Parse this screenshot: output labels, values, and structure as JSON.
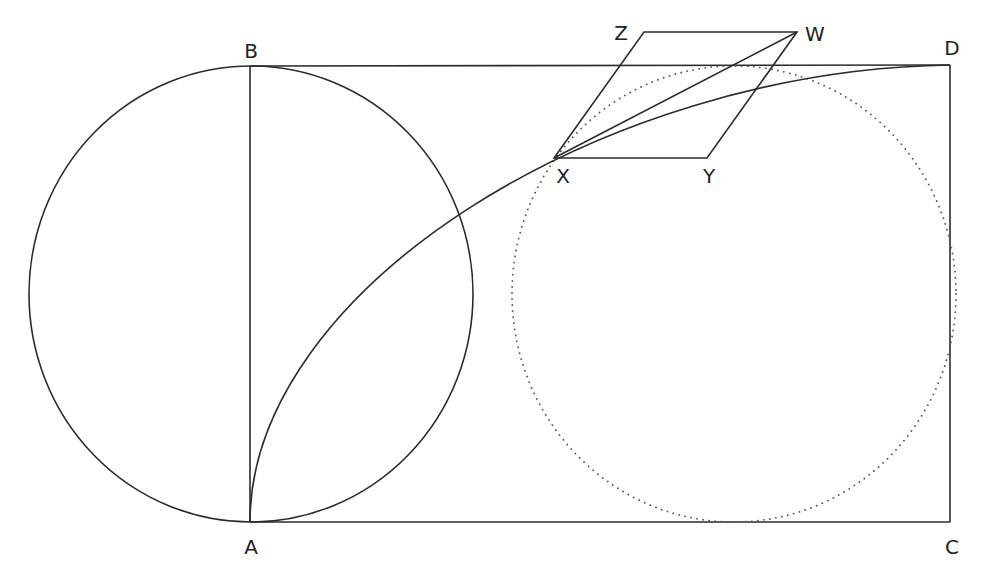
{
  "diagram": {
    "type": "geometric-construction",
    "labels": {
      "A": "A",
      "B": "B",
      "C": "C",
      "D": "D",
      "W": "W",
      "X": "X",
      "Y": "Y",
      "Z": "Z"
    },
    "points": {
      "A": [
        250,
        522
      ],
      "B": [
        250,
        66
      ],
      "C": [
        950,
        522
      ],
      "D": [
        950,
        65
      ],
      "X": [
        554,
        158
      ],
      "Y": [
        707,
        158
      ],
      "Z": [
        644,
        32
      ],
      "W": [
        797,
        32
      ]
    },
    "shapes": [
      {
        "kind": "ellipse",
        "style": "solid",
        "center": [
          251,
          294
        ],
        "rx": 222,
        "ry": 228,
        "description": "circle with diameter AB"
      },
      {
        "kind": "ellipse",
        "style": "dotted",
        "center": [
          734,
          294
        ],
        "rx": 222,
        "ry": 228,
        "description": "dotted circle inscribed in right part of rectangle"
      },
      {
        "kind": "segment",
        "from": "A",
        "to": "B"
      },
      {
        "kind": "segment",
        "from": "B",
        "to": "D"
      },
      {
        "kind": "segment",
        "from": "D",
        "to": "C"
      },
      {
        "kind": "segment",
        "from": "A",
        "to": "C"
      },
      {
        "kind": "curve",
        "from": "A",
        "to": "D",
        "through": "X"
      },
      {
        "kind": "parallelogram",
        "vertices": [
          "X",
          "Y",
          "W",
          "Z"
        ]
      },
      {
        "kind": "segment",
        "from": "X",
        "to": "W"
      }
    ],
    "colors": {
      "stroke": "#2b2b2b",
      "dotted": "#555555",
      "background": "#ffffff"
    }
  }
}
